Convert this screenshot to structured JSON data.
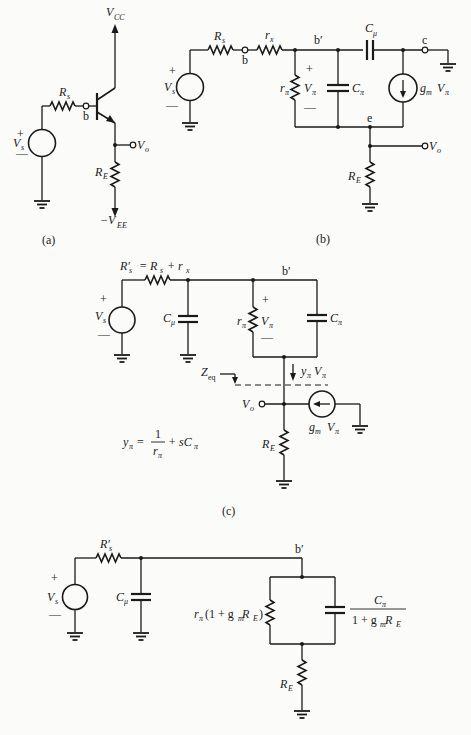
{
  "figure": {
    "panels": [
      {
        "id": "a",
        "caption": "(a)",
        "title": "Emitter follower (BJT) schematic",
        "labels": {
          "supply_top": "V",
          "supply_top_sub": "CC",
          "source_resistor": "R",
          "source_resistor_sub": "s",
          "base_node": "b",
          "source": "V",
          "source_sub": "s",
          "plus": "+",
          "minus": "—",
          "output": "V",
          "output_sub": "o",
          "emitter_resistor": "R",
          "emitter_resistor_sub": "E",
          "supply_bottom": "−V",
          "supply_bottom_sub": "EE"
        }
      },
      {
        "id": "b",
        "caption": "(b)",
        "title": "Hybrid-pi small-signal equivalent",
        "labels": {
          "source_resistor": "R",
          "source_resistor_sub": "s",
          "base_node": "b",
          "rx": "r",
          "rx_sub": "x",
          "internal_base": "b′",
          "c_mu": "C",
          "c_mu_sub": "μ",
          "collector_node": "c",
          "r_pi": "r",
          "r_pi_sub": "π",
          "v_pi": "V",
          "v_pi_sub": "π",
          "c_pi": "C",
          "c_pi_sub": "π",
          "gm": "g",
          "gm_sub": "m",
          "gm_v": "V",
          "gm_v_sub": "π",
          "emitter_node": "e",
          "output": "V",
          "output_sub": "o",
          "emitter_resistor": "R",
          "emitter_resistor_sub": "E",
          "source": "V",
          "source_sub": "s",
          "plus": "+",
          "minus": "—"
        }
      },
      {
        "id": "c",
        "caption": "(c)",
        "title": "Simplified equivalent with Z_eq",
        "labels": {
          "rs_prime": "R′",
          "rs_prime_sub": "s",
          "rs_prime_eq": "= R",
          "rs_eq_sub": "s",
          "rs_eq_plus": "+ r",
          "rs_eq_rx_sub": "x",
          "internal_base": "b′",
          "source": "V",
          "source_sub": "s",
          "c_mu": "C",
          "c_mu_sub": "μ",
          "r_pi": "r",
          "r_pi_sub": "π",
          "v_pi": "V",
          "v_pi_sub": "π",
          "c_pi": "C",
          "c_pi_sub": "π",
          "zeq": "Z",
          "zeq_sub": "eq",
          "y_current": "y",
          "y_current_sub": "π",
          "y_current_v": "V",
          "y_current_v_sub": "π",
          "output": "V",
          "output_sub": "o",
          "gm": "g",
          "gm_sub": "m",
          "gm_v": "V",
          "gm_v_sub": "π",
          "emitter_resistor": "R",
          "emitter_resistor_sub": "E",
          "plus": "+",
          "minus": "—",
          "eq_lhs": "y",
          "eq_lhs_sub": "π",
          "eq_equals": "=",
          "eq_num": "1",
          "eq_den": "r",
          "eq_den_sub": "π",
          "eq_rest": "+ sC",
          "eq_rest_sub": "π"
        }
      },
      {
        "id": "d",
        "caption": "",
        "title": "Reflected impedance equivalent",
        "labels": {
          "rs_prime": "R′",
          "rs_prime_sub": "s",
          "internal_base": "b′",
          "source": "V",
          "source_sub": "s",
          "c_mu": "C",
          "c_mu_sub": "μ",
          "r_eff_pre": "r",
          "r_eff_pi": "π",
          "r_eff_mid": "(1 + g",
          "r_eff_m": "m",
          "r_eff_R": " R",
          "r_eff_E": "E",
          "r_eff_close": ")",
          "c_eff_num": "C",
          "c_eff_num_sub": "π",
          "c_eff_den": "1 + g",
          "c_eff_den_m": "m",
          "c_eff_den_R": " R",
          "c_eff_den_E": "E",
          "emitter_resistor": "R",
          "emitter_resistor_sub": "E",
          "plus": "+",
          "minus": "—"
        }
      }
    ]
  }
}
